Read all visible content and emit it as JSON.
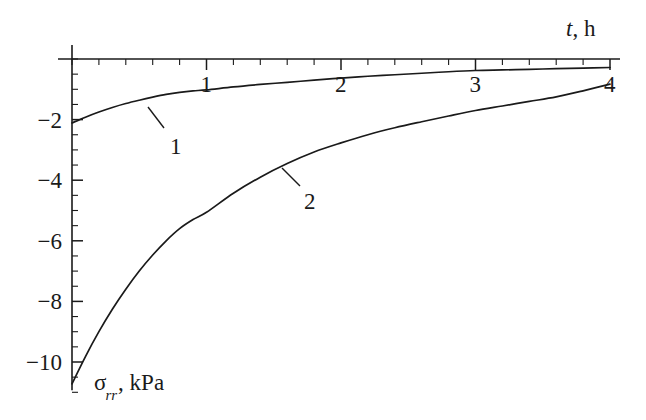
{
  "chart_data": {
    "type": "line",
    "title": "",
    "subtitle": "",
    "xlabel": "t, h",
    "ylabel": "σrr, kPa",
    "xlim": [
      0,
      4
    ],
    "ylim": [
      -11,
      0
    ],
    "grid": false,
    "legend": "inline-curve-labels",
    "x_ticks": [
      "1",
      "2",
      "3",
      "4"
    ],
    "x_tick_values": [
      1,
      2,
      3,
      4
    ],
    "x_minor_tick_step": 0.2,
    "y_ticks": [
      "−2",
      "−4",
      "−6",
      "−8",
      "−10"
    ],
    "y_tick_values": [
      -2,
      -4,
      -6,
      -8,
      -10
    ],
    "y_minor_tick_step": 0.5,
    "series": [
      {
        "name": "1",
        "label": "1",
        "color": "#1a1a1a",
        "x": [
          0.0,
          0.1,
          0.2,
          0.3,
          0.4,
          0.5,
          0.6,
          0.7,
          0.8,
          0.9,
          1.0,
          1.2,
          1.4,
          1.6,
          1.8,
          2.0,
          2.2,
          2.4,
          2.6,
          2.8,
          3.0,
          3.2,
          3.4,
          3.6,
          3.8,
          4.0
        ],
        "y": [
          -2.11,
          -1.92,
          -1.75,
          -1.6,
          -1.47,
          -1.36,
          -1.26,
          -1.17,
          -1.1,
          -1.05,
          -1.02,
          -0.92,
          -0.84,
          -0.77,
          -0.7,
          -0.63,
          -0.57,
          -0.52,
          -0.47,
          -0.42,
          -0.38,
          -0.36,
          -0.34,
          -0.32,
          -0.3,
          -0.28
        ]
      },
      {
        "name": "2",
        "label": "2",
        "color": "#1a1a1a",
        "x": [
          0.0,
          0.1,
          0.2,
          0.3,
          0.4,
          0.5,
          0.6,
          0.7,
          0.8,
          0.9,
          1.0,
          1.2,
          1.4,
          1.6,
          1.8,
          2.0,
          2.2,
          2.4,
          2.6,
          2.8,
          3.0,
          3.2,
          3.4,
          3.6,
          3.8,
          4.0
        ],
        "y": [
          -10.72,
          -9.82,
          -9.0,
          -8.26,
          -7.6,
          -7.0,
          -6.47,
          -6.0,
          -5.6,
          -5.3,
          -5.06,
          -4.43,
          -3.9,
          -3.45,
          -3.07,
          -2.77,
          -2.5,
          -2.27,
          -2.07,
          -1.88,
          -1.7,
          -1.55,
          -1.4,
          -1.25,
          -1.05,
          -0.83
        ]
      }
    ],
    "annotations": [
      {
        "text": "1",
        "label_x": 170,
        "label_y": 135,
        "leader_from_x": 148,
        "leader_from_y": 107,
        "leader_to_x": 164,
        "leader_to_y": 128
      },
      {
        "text": "2",
        "label_x": 304,
        "label_y": 190,
        "leader_from_x": 282,
        "leader_from_y": 168,
        "leader_to_x": 300,
        "leader_to_y": 186
      }
    ]
  },
  "axes": {
    "x_axis_title": "t, h",
    "x_axis_title_var": "t",
    "x_axis_title_rest": ", h",
    "y_axis_title_var": "σ",
    "y_axis_title_sub": "rr",
    "y_axis_title_rest": ", kPa"
  }
}
